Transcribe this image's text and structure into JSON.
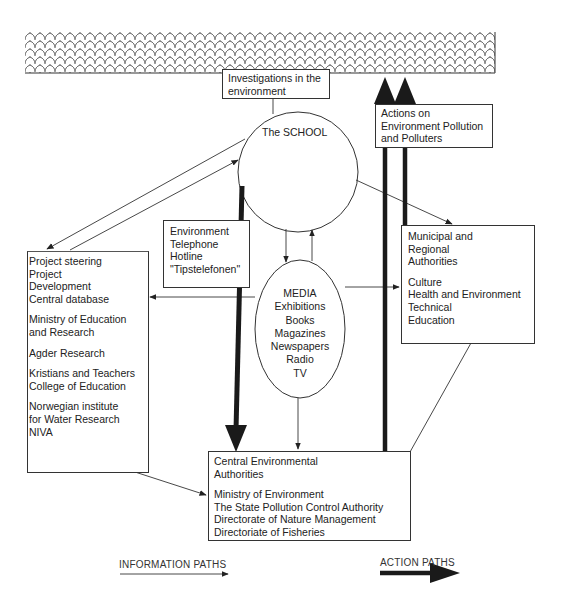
{
  "environment_band": {
    "pattern": "scalloped-roof-texture"
  },
  "investigations_box": {
    "lines": [
      "Investigations in the",
      "environment"
    ]
  },
  "actions_box": {
    "lines": [
      "Actions on",
      "Environment Pollution",
      "and Polluters"
    ]
  },
  "school": {
    "label": "The SCHOOL"
  },
  "hotline_box": {
    "lines": [
      "Environment",
      "Telephone",
      "Hotline",
      "\"Tipstelefonen\""
    ]
  },
  "project_box": {
    "lines": [
      "Project steering",
      "Project",
      "Development",
      "Central database",
      "",
      "Ministry of Education",
      "and Research",
      "",
      "Agder Research",
      "",
      "Kristians and Teachers",
      "College of Education",
      "",
      "Norwegian institute",
      "for Water Research",
      "NIVA"
    ]
  },
  "media": {
    "lines": [
      "MEDIA",
      "Exhibitions",
      "Books",
      "Magazines",
      "Newspapers",
      "Radio",
      "TV"
    ]
  },
  "municipal_box": {
    "lines": [
      "Municipal and",
      "Regional",
      "Authorities",
      "",
      "Culture",
      "Health and Environment",
      "Technical",
      "Education"
    ]
  },
  "central_box": {
    "lines": [
      "Central Environmental",
      "Authorities",
      "",
      "Ministry of Environment",
      "The State Pollution Control Authority",
      "Directorate of Nature Management",
      "Directoriate of Fisheries"
    ]
  },
  "legend": {
    "information_paths": "INFORMATION PATHS",
    "action_paths": "ACTION PATHS"
  },
  "colors": {
    "line": "#333333",
    "thick_arrow": "#1a1a1a",
    "background": "#ffffff"
  }
}
